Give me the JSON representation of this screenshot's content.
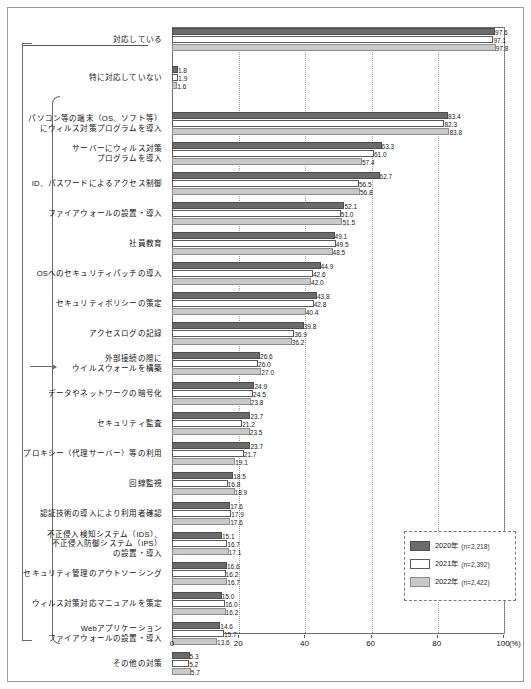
{
  "chart_data": {
    "type": "bar",
    "orientation": "horizontal",
    "title": "",
    "xlabel": "(%)",
    "ylabel": "",
    "xlim": [
      0,
      100
    ],
    "xticks": [
      "0",
      "20",
      "40",
      "60",
      "80",
      "100"
    ],
    "grid": true,
    "legend_position": "bottom-right",
    "unit": "(%)",
    "series": [
      {
        "name": "2020年",
        "n_label": "(n=2,218)",
        "color": "#6b6b6b"
      },
      {
        "name": "2021年",
        "n_label": "(n=2,392)",
        "color": "#ffffff"
      },
      {
        "name": "2022年",
        "n_label": "(n=2,422)",
        "color": "#c9c9c9"
      }
    ],
    "categories": [
      "対応している",
      "特に対応していない",
      "パソコン等の端末（OS、ソフト等）\nにウィルス対策プログラムを導入",
      "サーバーにウィルス対策\nプログラムを導入",
      "ID、パスワードによるアクセス制御",
      "ファイアウォールの設置・導入",
      "社員教育",
      "OSへのセキュリティパッチの導入",
      "セキュリティポリシーの策定",
      "アクセスログの記録",
      "外部接続の際に\nウイルスウォールを構築",
      "データやネットワークの暗号化",
      "セキュリティ監査",
      "プロキシー（代理サーバー）等の利用",
      "回線監視",
      "認証技術の導入により利用者確認",
      "不正侵入検知システム（IDS）、\n不正侵入防御システム（IPS）\nの設置・導入",
      "セキュリティ管理のアウトソーシング",
      "ウィルス対策対応マニュアルを策定",
      "Webアプリケーション\nファイアウォールの設置・導入",
      "その他の対策"
    ],
    "values": {
      "2020年": [
        97.6,
        1.8,
        83.4,
        63.3,
        62.7,
        52.1,
        49.1,
        44.9,
        43.8,
        39.8,
        26.6,
        24.9,
        23.7,
        23.7,
        18.5,
        17.6,
        15.1,
        16.6,
        15.0,
        14.6,
        5.3
      ],
      "2021年": [
        97.1,
        1.9,
        82.3,
        61.0,
        56.5,
        51.0,
        49.5,
        42.6,
        42.8,
        36.9,
        26.0,
        24.5,
        21.2,
        21.7,
        16.8,
        17.9,
        16.7,
        16.2,
        16.0,
        15.7,
        5.2
      ],
      "2022年": [
        97.8,
        1.6,
        83.8,
        57.4,
        56.8,
        51.5,
        48.5,
        42.0,
        40.4,
        36.2,
        27.0,
        23.8,
        23.5,
        19.1,
        18.9,
        17.6,
        17.1,
        16.7,
        16.2,
        13.6,
        5.7
      ]
    }
  }
}
